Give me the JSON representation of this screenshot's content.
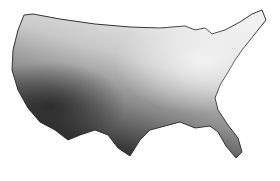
{
  "map": {
    "subject": "Contiguous United States",
    "style": "grayscale contour shading",
    "colors": {
      "background": "#ffffff",
      "light": "#e8e8e8",
      "mid": "#9a9a9a",
      "dark": "#2a2a2a",
      "outline": "#333333"
    }
  }
}
